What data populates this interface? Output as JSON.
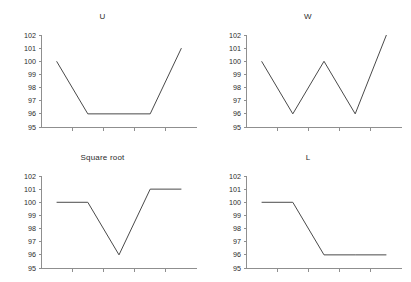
{
  "figure": {
    "background_color": "#ffffff",
    "axis_color": "#8f8f8f",
    "line_color": "#4a4a4a",
    "text_color": "#2b2b2b",
    "layout": "2x2 grid of line charts"
  },
  "panels": [
    {
      "key": "u",
      "title": "U",
      "position": "top-left"
    },
    {
      "key": "w",
      "title": "W",
      "position": "top-right"
    },
    {
      "key": "square_root",
      "title": "Square root",
      "position": "bottom-left"
    },
    {
      "key": "l",
      "title": "L",
      "position": "bottom-right"
    }
  ],
  "axis": {
    "y_tick_labels": [
      "102",
      "101",
      "100",
      "99",
      "98",
      "97",
      "96",
      "95"
    ],
    "y_min": 95,
    "y_max": 102,
    "y_step": 1,
    "x_tick_count": 5,
    "x_tick_labels": []
  },
  "chart_data": [
    {
      "type": "line",
      "title": "U",
      "xlabel": "",
      "ylabel": "",
      "x": [
        1,
        2,
        3,
        4,
        5
      ],
      "values": [
        100,
        96,
        96,
        96,
        101
      ],
      "ylim": [
        95,
        102
      ],
      "yticks": [
        95,
        96,
        97,
        98,
        99,
        100,
        101,
        102
      ],
      "grid": false,
      "legend": false
    },
    {
      "type": "line",
      "title": "W",
      "xlabel": "",
      "ylabel": "",
      "x": [
        1,
        2,
        3,
        4,
        5
      ],
      "values": [
        100,
        96,
        100,
        96,
        102
      ],
      "ylim": [
        95,
        102
      ],
      "yticks": [
        95,
        96,
        97,
        98,
        99,
        100,
        101,
        102
      ],
      "grid": false,
      "legend": false
    },
    {
      "type": "line",
      "title": "Square root",
      "xlabel": "",
      "ylabel": "",
      "x": [
        1,
        2,
        3,
        4,
        5
      ],
      "values": [
        100,
        100,
        96,
        101,
        101
      ],
      "ylim": [
        95,
        102
      ],
      "yticks": [
        95,
        96,
        97,
        98,
        99,
        100,
        101,
        102
      ],
      "grid": false,
      "legend": false
    },
    {
      "type": "line",
      "title": "L",
      "xlabel": "",
      "ylabel": "",
      "x": [
        1,
        2,
        3,
        4,
        5
      ],
      "values": [
        100,
        100,
        96,
        96,
        96
      ],
      "ylim": [
        95,
        102
      ],
      "yticks": [
        95,
        96,
        97,
        98,
        99,
        100,
        101,
        102
      ],
      "grid": false,
      "legend": false
    }
  ]
}
